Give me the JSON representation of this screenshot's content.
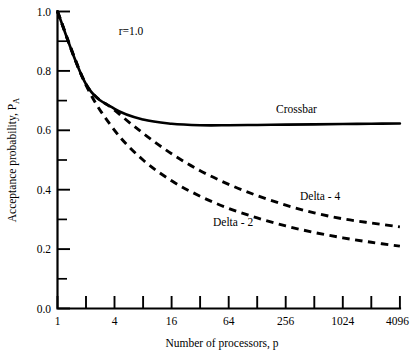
{
  "chart_data": {
    "type": "line",
    "title": "",
    "xlabel": "Number of processors, p",
    "ylabel": "Acceptance probability, P",
    "ylabel_subscript": "A",
    "annotation": "r=1.0",
    "xscale": "log2",
    "xlim": [
      1,
      4096
    ],
    "ylim": [
      0.0,
      1.0
    ],
    "grid": false,
    "legend_position": "inline-curve-labels",
    "x_tick_values": [
      1,
      2,
      4,
      8,
      16,
      32,
      64,
      128,
      256,
      512,
      1024,
      2048,
      4096
    ],
    "x_tick_labels": [
      "1",
      "",
      "4",
      "",
      "16",
      "",
      "64",
      "",
      "256",
      "",
      "1024",
      "",
      "4096"
    ],
    "x_labeled_ticks": [
      "1",
      "4",
      "16",
      "64",
      "256",
      "1024",
      "4096"
    ],
    "y_tick_values": [
      0.0,
      0.1,
      0.2,
      0.3,
      0.4,
      0.5,
      0.6,
      0.7,
      0.8,
      0.9,
      1.0
    ],
    "y_tick_labels": [
      "0.0",
      "",
      "0.2",
      "",
      "0.4",
      "",
      "0.6",
      "",
      "0.8",
      "",
      "1.0"
    ],
    "y_labeled_ticks": [
      "0.0",
      "0.2",
      "0.4",
      "0.6",
      "0.8",
      "1.0"
    ],
    "x": [
      1,
      2,
      4,
      8,
      16,
      32,
      64,
      128,
      256,
      512,
      1024,
      2048,
      4096
    ],
    "series": [
      {
        "name": "Crossbar",
        "style": "solid",
        "label": "Crossbar",
        "values": [
          1.0,
          0.755,
          0.672,
          0.636,
          0.622,
          0.617,
          0.617,
          0.618,
          0.619,
          0.62,
          0.621,
          0.622,
          0.623
        ]
      },
      {
        "name": "Delta - 4",
        "style": "dashed",
        "label": "Delta - 4",
        "values": [
          1.0,
          0.755,
          0.668,
          0.59,
          0.521,
          0.464,
          0.418,
          0.38,
          0.348,
          0.322,
          0.302,
          0.288,
          0.275
        ]
      },
      {
        "name": "Delta - 2",
        "style": "dashed",
        "label": "Delta - 2",
        "values": [
          1.0,
          0.752,
          0.6,
          0.5,
          0.43,
          0.378,
          0.337,
          0.305,
          0.278,
          0.256,
          0.238,
          0.223,
          0.21
        ]
      }
    ],
    "colors": {
      "curve": "#000000",
      "axis": "#000000",
      "background": "#ffffff"
    }
  },
  "labels": {
    "y_axis_title_main": "Acceptance probability, P",
    "y_axis_title_sub": "A",
    "x_axis_title": "Number of processors, p",
    "annotation_r": "r=1.0",
    "crossbar": "Crossbar",
    "delta4": "Delta - 4",
    "delta2": "Delta - 2",
    "ytick_0": "0.0",
    "ytick_1": "0.2",
    "ytick_2": "0.4",
    "ytick_3": "0.6",
    "ytick_4": "0.8",
    "ytick_5": "1.0",
    "xtick_0": "1",
    "xtick_1": "4",
    "xtick_2": "16",
    "xtick_3": "64",
    "xtick_4": "256",
    "xtick_5": "1024",
    "xtick_6": "4096"
  }
}
